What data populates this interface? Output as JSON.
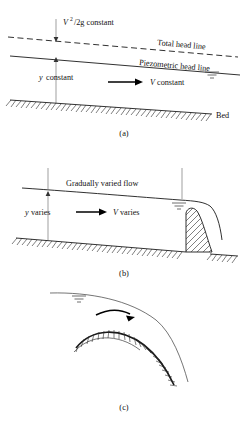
{
  "figure": {
    "panels": [
      {
        "id": "a",
        "caption": "(a)",
        "labels": {
          "velocity_head": "/2g constant",
          "velocity_head_symbol": "V",
          "velocity_head_exponent": "2",
          "total_head_line": "Total head line",
          "piezometric_head_line": "Piezometric head line",
          "depth": "constant",
          "depth_symbol": "y",
          "velocity": "constant",
          "velocity_symbol": "V",
          "bed": "Bed"
        }
      },
      {
        "id": "b",
        "caption": "(b)",
        "labels": {
          "flow_type": "Gradually varied flow",
          "depth": "varies",
          "depth_symbol": "y",
          "velocity": "varies",
          "velocity_symbol": "V"
        }
      },
      {
        "id": "c",
        "caption": "(c)",
        "labels": {}
      }
    ]
  },
  "colors": {
    "ink": "#1a1a1a",
    "thin_ink": "#3a3a3a",
    "guide": "#777777",
    "background": "#ffffff"
  }
}
